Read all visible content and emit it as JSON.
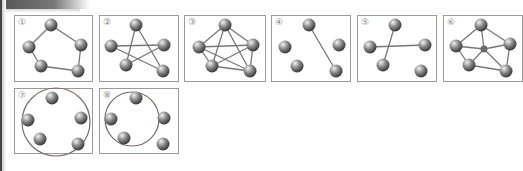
{
  "figure": {
    "panels": [
      {
        "label": "①",
        "x": 14,
        "y": 15,
        "w": 79,
        "h": 67,
        "nodes": [
          [
            36,
            9
          ],
          [
            14,
            31
          ],
          [
            66,
            29
          ],
          [
            26,
            50
          ],
          [
            63,
            55
          ]
        ],
        "edges": [
          [
            0,
            1
          ],
          [
            0,
            2
          ],
          [
            1,
            3
          ],
          [
            2,
            4
          ],
          [
            3,
            4
          ]
        ],
        "circle": null
      },
      {
        "label": "②",
        "x": 99,
        "y": 15,
        "w": 80,
        "h": 67,
        "nodes": [
          [
            36,
            9
          ],
          [
            11,
            30
          ],
          [
            64,
            29
          ],
          [
            26,
            49
          ],
          [
            63,
            55
          ]
        ],
        "edges": [
          [
            0,
            3
          ],
          [
            0,
            4
          ],
          [
            1,
            2
          ],
          [
            1,
            4
          ],
          [
            2,
            3
          ]
        ],
        "circle": null
      },
      {
        "label": "③",
        "x": 184,
        "y": 15,
        "w": 82,
        "h": 67,
        "nodes": [
          [
            40,
            9
          ],
          [
            14,
            31
          ],
          [
            68,
            29
          ],
          [
            27,
            50
          ],
          [
            65,
            55
          ]
        ],
        "edges": [
          [
            0,
            1
          ],
          [
            0,
            2
          ],
          [
            0,
            3
          ],
          [
            0,
            4
          ],
          [
            1,
            2
          ],
          [
            1,
            3
          ],
          [
            1,
            4
          ],
          [
            2,
            3
          ],
          [
            2,
            4
          ],
          [
            3,
            4
          ]
        ],
        "circle": null
      },
      {
        "label": "④",
        "x": 271,
        "y": 15,
        "w": 80,
        "h": 67,
        "nodes": [
          [
            37,
            9
          ],
          [
            13,
            31
          ],
          [
            67,
            29
          ],
          [
            25,
            50
          ],
          [
            64,
            55
          ]
        ],
        "edges": [
          [
            0,
            4
          ]
        ],
        "circle": null
      },
      {
        "label": "⑤",
        "x": 357,
        "y": 15,
        "w": 80,
        "h": 67,
        "nodes": [
          [
            37,
            9
          ],
          [
            12,
            31
          ],
          [
            67,
            29
          ],
          [
            25,
            49
          ],
          [
            63,
            55
          ]
        ],
        "edges": [
          [
            0,
            3
          ],
          [
            1,
            2
          ]
        ],
        "circle": null
      },
      {
        "label": "⑥",
        "x": 443,
        "y": 15,
        "w": 80,
        "h": 67,
        "nodes": [
          [
            37,
            9
          ],
          [
            12,
            30
          ],
          [
            66,
            28
          ],
          [
            25,
            49
          ],
          [
            62,
            55
          ],
          [
            40,
            33,
            "small"
          ]
        ],
        "edges": [
          [
            0,
            1
          ],
          [
            0,
            2
          ],
          [
            2,
            4
          ],
          [
            3,
            4
          ],
          [
            1,
            3
          ],
          [
            5,
            0
          ],
          [
            5,
            1
          ],
          [
            5,
            2
          ],
          [
            5,
            3
          ],
          [
            5,
            4
          ]
        ],
        "circle": null
      },
      {
        "label": "⑦",
        "x": 14,
        "y": 88,
        "w": 79,
        "h": 66,
        "nodes": [
          [
            37,
            9
          ],
          [
            13,
            31
          ],
          [
            66,
            29
          ],
          [
            25,
            50
          ],
          [
            63,
            55
          ]
        ],
        "edges": [],
        "circle": {
          "cx": 41,
          "cy": 33,
          "r": 34
        }
      },
      {
        "label": "⑧",
        "x": 99,
        "y": 88,
        "w": 80,
        "h": 66,
        "nodes": [
          [
            36,
            9
          ],
          [
            11,
            30
          ],
          [
            64,
            29
          ],
          [
            24,
            49
          ],
          [
            63,
            55
          ]
        ],
        "edges": [],
        "circle": {
          "cx": 32,
          "cy": 30,
          "r": 27
        }
      }
    ]
  },
  "colors": {
    "edge": "#777777",
    "border": "#9a9a9a",
    "node_light": "#f2f2f2",
    "node_mid": "#8a8a8a",
    "node_dark": "#3a3a3a",
    "label": "#888888"
  }
}
